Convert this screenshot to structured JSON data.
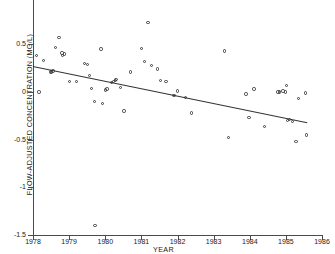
{
  "chart_data": {
    "type": "scatter",
    "title": "",
    "xlabel": "YEAR",
    "ylabel": "FLOW-ADJUSTED CONCENTRATION (MG/L)",
    "xlim": [
      1978,
      1986
    ],
    "ylim": [
      -1.5,
      0.95
    ],
    "grid": false,
    "legend": false,
    "xticks": [
      1978,
      1979,
      1980,
      1981,
      1982,
      1983,
      1984,
      1985,
      1986
    ],
    "xtick_labels": [
      "1978",
      "1979",
      "1980",
      "1981",
      "1982",
      "1983",
      "1984",
      "1985",
      "1986"
    ],
    "yticks": [
      0.5,
      0,
      -0.5,
      -1,
      -1.5
    ],
    "ytick_labels": [
      "0.5",
      "0",
      "-0.5",
      "-1",
      "-1.5"
    ],
    "marker": "open-circle",
    "marker_color": "#3b3b3b",
    "series": [
      {
        "name": "flow-adjusted concentration",
        "points": [
          [
            1978.1,
            0.38
          ],
          [
            1978.17,
            0.0
          ],
          [
            1978.3,
            0.33
          ],
          [
            1978.48,
            0.21
          ],
          [
            1978.52,
            0.21
          ],
          [
            1978.55,
            0.22
          ],
          [
            1978.62,
            0.47
          ],
          [
            1978.72,
            0.57
          ],
          [
            1978.8,
            0.41
          ],
          [
            1978.82,
            0.38
          ],
          [
            1978.88,
            0.4
          ],
          [
            1979.02,
            0.11
          ],
          [
            1979.2,
            0.11
          ],
          [
            1979.42,
            0.3
          ],
          [
            1979.5,
            0.29
          ],
          [
            1979.56,
            0.17
          ],
          [
            1979.62,
            0.04
          ],
          [
            1979.7,
            -0.1
          ],
          [
            1979.72,
            -1.4
          ],
          [
            1979.88,
            0.45
          ],
          [
            1979.92,
            -0.12
          ],
          [
            1980.0,
            0.02
          ],
          [
            1980.05,
            0.03
          ],
          [
            1980.18,
            0.1
          ],
          [
            1980.22,
            0.11
          ],
          [
            1980.28,
            0.12
          ],
          [
            1980.3,
            0.13
          ],
          [
            1980.42,
            0.05
          ],
          [
            1980.52,
            -0.2
          ],
          [
            1980.7,
            0.21
          ],
          [
            1981.0,
            0.46
          ],
          [
            1981.08,
            0.32
          ],
          [
            1981.18,
            0.73
          ],
          [
            1981.28,
            0.28
          ],
          [
            1981.45,
            0.24
          ],
          [
            1981.52,
            0.12
          ],
          [
            1981.68,
            0.11
          ],
          [
            1981.9,
            -0.04
          ],
          [
            1982.0,
            0.01
          ],
          [
            1982.22,
            -0.06
          ],
          [
            1982.38,
            -0.22
          ],
          [
            1983.3,
            0.43
          ],
          [
            1983.42,
            -0.48
          ],
          [
            1983.9,
            -0.02
          ],
          [
            1983.98,
            -0.27
          ],
          [
            1984.12,
            0.03
          ],
          [
            1984.4,
            -0.36
          ],
          [
            1984.78,
            0.0
          ],
          [
            1984.82,
            0.0
          ],
          [
            1984.92,
            0.01
          ],
          [
            1984.98,
            0.0
          ],
          [
            1985.02,
            0.07
          ],
          [
            1985.05,
            -0.3
          ],
          [
            1985.1,
            -0.29
          ],
          [
            1985.18,
            -0.31
          ],
          [
            1985.28,
            -0.52
          ],
          [
            1985.35,
            -0.07
          ],
          [
            1985.55,
            -0.01
          ],
          [
            1985.58,
            -0.45
          ]
        ]
      }
    ],
    "trendline": {
      "name": "linear trend",
      "x0": 1978.0,
      "y0": 0.27,
      "x1": 1985.6,
      "y1": -0.32,
      "color": "#333333"
    }
  }
}
